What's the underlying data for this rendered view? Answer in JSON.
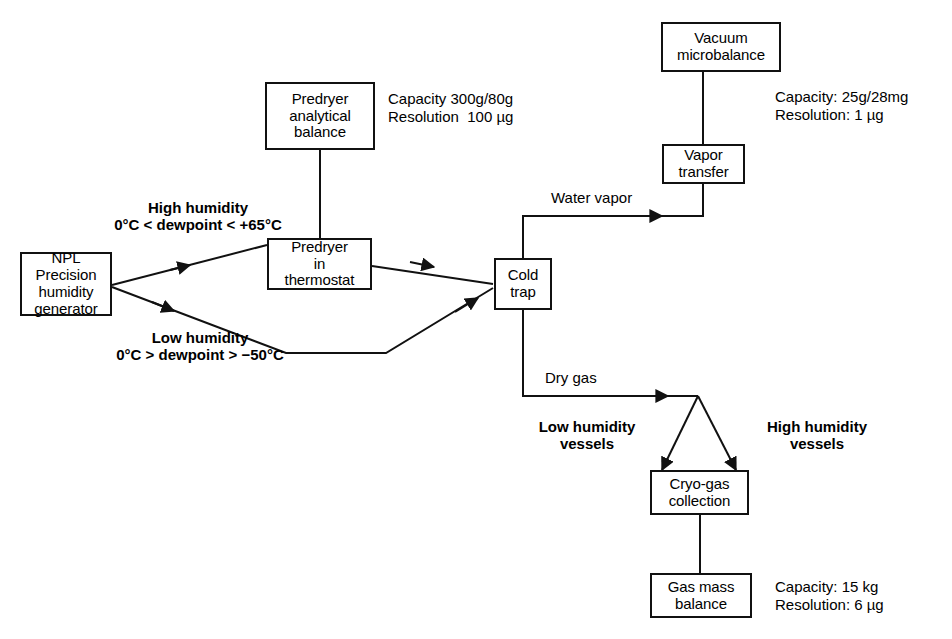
{
  "diagram": {
    "nodes": {
      "npl_generator": "NPL\nPrecision\nhumidity\ngenerator",
      "predryer_balance": "Predryer\nanalytical\nbalance",
      "predryer_thermostat": "Predryer\nin\nthermostat",
      "cold_trap": "Cold\ntrap",
      "vacuum_microbalance": "Vacuum\nmicrobalance",
      "vapor_transfer": "Vapor\ntransfer",
      "cryo_gas_collection": "Cryo-gas\ncollection",
      "gas_mass_balance": "Gas mass\nbalance"
    },
    "edge_labels": {
      "high_humidity_title": "High humidity",
      "high_humidity_range": "0°C < dewpoint < +65°C",
      "low_humidity_title": "Low humidity",
      "low_humidity_range": "0°C > dewpoint > −50°C",
      "water_vapor": "Water vapor",
      "dry_gas": "Dry gas",
      "low_humidity_vessels": "Low humidity\nvessels",
      "high_humidity_vessels": "High humidity\nvessels"
    },
    "specs": {
      "predryer_balance_spec": "Capacity 300g/80g\nResolution  100 µg",
      "vacuum_microbalance_spec": "Capacity: 25g/28mg\nResolution: 1 µg",
      "gas_mass_balance_spec": "Capacity: 15 kg\nResolution: 6 µg"
    },
    "colors": {
      "stroke": "#111111",
      "background": "#ffffff",
      "text": "#000000"
    }
  }
}
